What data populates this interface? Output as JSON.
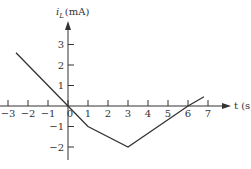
{
  "chart_data": {
    "type": "line",
    "title": "",
    "xlabel": "t (s)",
    "ylabel_main": "i",
    "ylabel_sub": "L",
    "ylabel_unit": "(mA)",
    "xlim": [
      -3.3,
      7.8
    ],
    "ylim": [
      -2.4,
      4.2
    ],
    "x_ticks": [
      -3,
      -2,
      -1,
      0,
      1,
      2,
      3,
      4,
      5,
      6,
      7
    ],
    "x_tick_labels": [
      "−3",
      "−2",
      "−1",
      "0",
      "1",
      "2",
      "3",
      "4",
      "5",
      "6",
      "7"
    ],
    "y_ticks": [
      -2,
      -1,
      1,
      2,
      3
    ],
    "y_tick_labels": [
      "−2",
      "−1",
      "1",
      "2",
      "3"
    ],
    "grid": false,
    "legend": null,
    "series": [
      {
        "name": "i_L",
        "x": [
          -2.6,
          0,
          1,
          3,
          6,
          6.8
        ],
        "y": [
          2.6,
          0,
          -1,
          -2,
          0,
          0.45
        ]
      }
    ],
    "colors": {
      "line": "#333333",
      "axis": "#333333"
    }
  }
}
